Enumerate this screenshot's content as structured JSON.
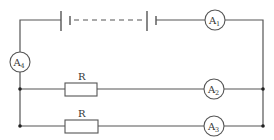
{
  "diagram": {
    "type": "electric-circuit",
    "components": {
      "battery": {
        "kind": "multi-cell battery",
        "cells_shown": 2,
        "dashed_between": true
      },
      "ammeters": [
        {
          "id": "A1",
          "letter": "A",
          "subscript": "1",
          "location": "top wire, right of battery"
        },
        {
          "id": "A2",
          "letter": "A",
          "subscript": "2",
          "location": "upper parallel branch"
        },
        {
          "id": "A3",
          "letter": "A",
          "subscript": "3",
          "location": "lower parallel branch"
        },
        {
          "id": "A4",
          "letter": "A",
          "subscript": "4",
          "location": "left vertical wire"
        }
      ],
      "resistors": [
        {
          "label": "R",
          "location": "upper parallel branch"
        },
        {
          "label": "R",
          "location": "lower parallel branch"
        }
      ],
      "junctions": 4
    }
  }
}
